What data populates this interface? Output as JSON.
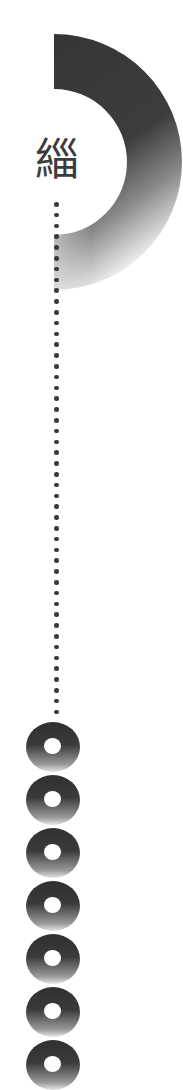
{
  "title_glyph": "緇",
  "colors": {
    "ring_dark": "#3a3a3a",
    "ring_fade": "#f0f0f0",
    "dot": "#3a3a3a",
    "background": "#ffffff"
  },
  "ring": {
    "center_x": 54,
    "center_y": 162,
    "outer_radius": 128,
    "inner_radius": 73
  },
  "dots": {
    "count": 48,
    "start_y": 204,
    "pitch": 10.8
  },
  "discs": {
    "count": 7,
    "start_y": 722,
    "pitch": 53
  }
}
